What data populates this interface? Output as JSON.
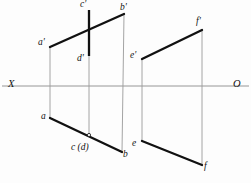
{
  "figure": {
    "type": "descriptive-geometry-projection",
    "width": 251,
    "height": 183,
    "background_color": "#fdfdfd",
    "ink_color": "#111111",
    "thin_line_color": "#8a8a8a"
  },
  "axis": {
    "ground_line_label_left": "X",
    "ground_line_label_right": "O",
    "y": 86,
    "x_start": 2,
    "x_end": 249,
    "left_label_pos": {
      "x": 8,
      "y": 80
    },
    "right_label_pos": {
      "x": 233,
      "y": 80
    }
  },
  "labels": {
    "a_prime": "a'",
    "b_prime": "b'",
    "c_prime": "c'",
    "d_prime": "d'",
    "a": "a",
    "b": "b",
    "cd": "c (d)",
    "e_prime": "e'",
    "f_prime": "f'",
    "e": "e",
    "f": "f"
  },
  "points": {
    "a_prime": {
      "x": 50,
      "y": 47
    },
    "b_prime": {
      "x": 124,
      "y": 14
    },
    "c_prime": {
      "x": 89,
      "y": 10
    },
    "d_prime": {
      "x": 89,
      "y": 56
    },
    "a": {
      "x": 50,
      "y": 118
    },
    "b": {
      "x": 122,
      "y": 152
    },
    "cd": {
      "x": 89,
      "y": 135
    },
    "e_prime": {
      "x": 142,
      "y": 59
    },
    "f_prime": {
      "x": 202,
      "y": 30
    },
    "e": {
      "x": 142,
      "y": 141
    },
    "f": {
      "x": 202,
      "y": 165
    }
  },
  "label_positions": {
    "a_prime": {
      "x": 38,
      "y": 39
    },
    "b_prime": {
      "x": 120,
      "y": 3
    },
    "c_prime": {
      "x": 80,
      "y": 0
    },
    "d_prime": {
      "x": 78,
      "y": 55
    },
    "a": {
      "x": 41,
      "y": 113
    },
    "b": {
      "x": 122,
      "y": 150
    },
    "cd": {
      "x": 71,
      "y": 143
    },
    "e_prime": {
      "x": 131,
      "y": 52
    },
    "f_prime": {
      "x": 196,
      "y": 18
    },
    "e": {
      "x": 133,
      "y": 140
    },
    "f": {
      "x": 203,
      "y": 163
    }
  },
  "segments": {
    "thick": [
      {
        "name": "ab-prime-front-view",
        "x1": 50,
        "y1": 47,
        "x2": 124,
        "y2": 14
      },
      {
        "name": "cd-prime-front-view",
        "x1": 89,
        "y1": 10,
        "x2": 89,
        "y2": 56
      },
      {
        "name": "ab-top-view",
        "x1": 50,
        "y1": 118,
        "x2": 122,
        "y2": 152
      },
      {
        "name": "ef-prime-front-view",
        "x1": 142,
        "y1": 59,
        "x2": 202,
        "y2": 30
      },
      {
        "name": "ef-top-view",
        "x1": 142,
        "y1": 141,
        "x2": 202,
        "y2": 165
      }
    ],
    "thin": [
      {
        "name": "projector-a",
        "x1": 50,
        "y1": 47,
        "x2": 50,
        "y2": 118
      },
      {
        "name": "projector-cd",
        "x1": 89,
        "y1": 56,
        "x2": 89,
        "y2": 135
      },
      {
        "name": "projector-b",
        "x1": 124,
        "y1": 14,
        "x2": 122,
        "y2": 152
      },
      {
        "name": "projector-e",
        "x1": 142,
        "y1": 59,
        "x2": 142,
        "y2": 141
      },
      {
        "name": "projector-f",
        "x1": 202,
        "y1": 30,
        "x2": 202,
        "y2": 165
      }
    ]
  }
}
